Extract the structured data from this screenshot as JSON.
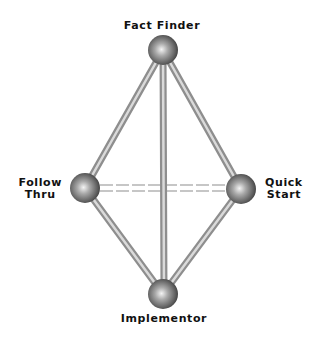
{
  "diagram": {
    "type": "ball-and-stick",
    "nodes": [
      {
        "id": "fact_finder",
        "label": "Fact Finder",
        "lines": [
          "Fact Finder"
        ],
        "x": 163,
        "y": 50
      },
      {
        "id": "follow_thru",
        "label": "Follow Thru",
        "lines": [
          "Follow",
          "Thru"
        ],
        "x": 85,
        "y": 188
      },
      {
        "id": "quick_start",
        "label": "Quick Start",
        "lines": [
          "Quick",
          "Start"
        ],
        "x": 241,
        "y": 189
      },
      {
        "id": "implementor",
        "label": "Implementor",
        "lines": [
          "Implementor"
        ],
        "x": 163,
        "y": 294
      }
    ],
    "edges": [
      {
        "from": "fact_finder",
        "to": "follow_thru",
        "style": "solid"
      },
      {
        "from": "fact_finder",
        "to": "quick_start",
        "style": "solid"
      },
      {
        "from": "fact_finder",
        "to": "implementor",
        "style": "solid"
      },
      {
        "from": "follow_thru",
        "to": "implementor",
        "style": "solid"
      },
      {
        "from": "quick_start",
        "to": "implementor",
        "style": "solid"
      },
      {
        "from": "follow_thru",
        "to": "quick_start",
        "style": "dashed-double"
      }
    ]
  },
  "labels": {
    "fact_finder": "Fact Finder",
    "follow_line1": "Follow",
    "follow_line2": "Thru",
    "quick_line1": "Quick",
    "quick_line2": "Start",
    "implementor": "Implementor"
  },
  "colors": {
    "rod_dark": "#8a8a8a",
    "rod_light": "#d8d8d8",
    "ball_dark": "#3a3a3a",
    "ball_mid": "#8c8c8c",
    "ball_light": "#f2f2f2",
    "dash": "#c8c8c8",
    "text": "#111111"
  }
}
